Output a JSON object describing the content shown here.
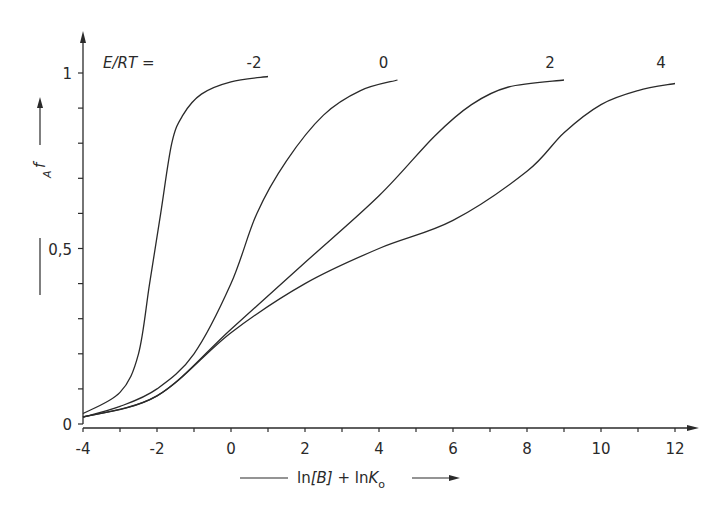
{
  "chart_data": {
    "type": "line",
    "title": "",
    "xlabel": "ln[B] + lnK_o",
    "ylabel": "f_A",
    "legend_title": "E/RT =",
    "xlim": [
      -4,
      12.6
    ],
    "ylim": [
      0,
      1.08
    ],
    "grid": false,
    "x_ticks": [
      -4,
      -2,
      0,
      2,
      4,
      6,
      8,
      10,
      12
    ],
    "x_tick_labels": [
      "-4",
      "-2",
      "0",
      "2",
      "4",
      "6",
      "8",
      "10",
      "12"
    ],
    "y_ticks": [
      0,
      0.1,
      0.2,
      0.3,
      0.4,
      0.5,
      0.6,
      0.7,
      0.8,
      0.9,
      1.0
    ],
    "y_tick_labels": {
      "0": "0",
      "0.5": "0,5",
      "1": "1"
    },
    "series": [
      {
        "name": "-2",
        "x": [
          -4,
          -3,
          -2.5,
          -2.2,
          -1.9,
          -1.6,
          -1.3,
          -0.8,
          0,
          1
        ],
        "y": [
          0.03,
          0.09,
          0.2,
          0.4,
          0.6,
          0.8,
          0.88,
          0.94,
          0.975,
          0.99
        ]
      },
      {
        "name": "0",
        "x": [
          -4,
          -3,
          -2,
          -1,
          0,
          0.7,
          1.5,
          2.5,
          3.5,
          4.5
        ],
        "y": [
          0.02,
          0.05,
          0.1,
          0.2,
          0.4,
          0.6,
          0.75,
          0.88,
          0.95,
          0.98
        ]
      },
      {
        "name": "2",
        "x": [
          -4,
          -2,
          0,
          2,
          4,
          5.5,
          6.5,
          7.5,
          9
        ],
        "y": [
          0.02,
          0.08,
          0.27,
          0.46,
          0.65,
          0.82,
          0.91,
          0.96,
          0.98
        ]
      },
      {
        "name": "4",
        "x": [
          -4,
          -2,
          0,
          2,
          4,
          6,
          8,
          9,
          10,
          11,
          12
        ],
        "y": [
          0.02,
          0.08,
          0.26,
          0.4,
          0.5,
          0.58,
          0.72,
          0.83,
          0.91,
          0.95,
          0.97
        ]
      }
    ]
  },
  "labels": {
    "legend_prefix": "E/RT =",
    "y_axis": "f",
    "y_axis_sub": "A",
    "x_axis_part1": "ln",
    "x_axis_part2": "[B]",
    "x_axis_part3": " + ln",
    "x_axis_part4": "K",
    "x_axis_sub": "o"
  },
  "colors": {
    "line": "#2a2a2a",
    "background": "#ffffff"
  }
}
